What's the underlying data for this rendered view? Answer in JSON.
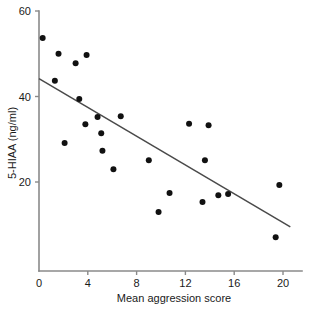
{
  "chart_data": {
    "type": "scatter",
    "title": "",
    "subtitle": "",
    "xlabel": "Mean aggression score",
    "ylabel": "5-HIAA (ng/ml)",
    "xlim": [
      0,
      21.5
    ],
    "ylim": [
      0,
      60
    ],
    "xticks": [
      0,
      4,
      8,
      12,
      16,
      20
    ],
    "yticks": [
      20,
      40,
      60
    ],
    "xtick_labels": [
      "0",
      "4",
      "8",
      "12",
      "16",
      "20"
    ],
    "ytick_labels": [
      "20",
      "40",
      "60"
    ],
    "grid": false,
    "legend": null,
    "marker": "filled-circle",
    "marker_color": "#111111",
    "points": [
      {
        "x": 0.3,
        "y": 53.7
      },
      {
        "x": 1.3,
        "y": 43.7
      },
      {
        "x": 1.6,
        "y": 50.0
      },
      {
        "x": 2.1,
        "y": 29.1
      },
      {
        "x": 3.0,
        "y": 47.8
      },
      {
        "x": 3.3,
        "y": 39.4
      },
      {
        "x": 3.8,
        "y": 33.5
      },
      {
        "x": 3.9,
        "y": 49.7
      },
      {
        "x": 4.8,
        "y": 35.2
      },
      {
        "x": 5.1,
        "y": 31.4
      },
      {
        "x": 5.2,
        "y": 27.3
      },
      {
        "x": 6.1,
        "y": 23.0
      },
      {
        "x": 6.7,
        "y": 35.4
      },
      {
        "x": 9.0,
        "y": 25.1
      },
      {
        "x": 9.8,
        "y": 13.0
      },
      {
        "x": 10.7,
        "y": 17.4
      },
      {
        "x": 12.3,
        "y": 33.6
      },
      {
        "x": 13.4,
        "y": 15.3
      },
      {
        "x": 13.6,
        "y": 25.1
      },
      {
        "x": 13.9,
        "y": 33.3
      },
      {
        "x": 14.7,
        "y": 16.9
      },
      {
        "x": 15.5,
        "y": 17.2
      },
      {
        "x": 19.4,
        "y": 7.1
      },
      {
        "x": 19.7,
        "y": 19.3
      }
    ],
    "fit_line": {
      "type": "linear-regression",
      "x_start": 0.0,
      "y_start": 44.2,
      "x_end": 20.6,
      "y_end": 9.5,
      "color": "#4a4a4a"
    },
    "axis_color": "#8a8a8a",
    "background_color": "#ffffff"
  }
}
